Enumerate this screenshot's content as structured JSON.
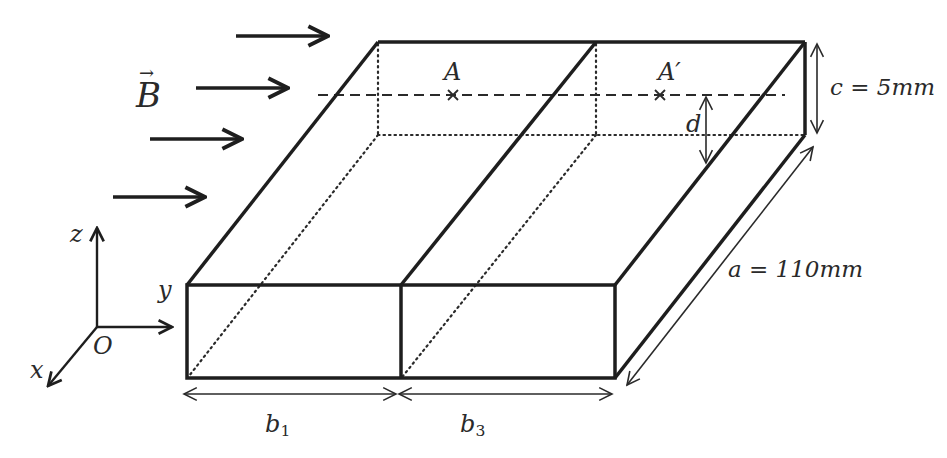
{
  "diagram": {
    "type": "3d-box-with-magnetic-field",
    "field": {
      "symbol": "B",
      "vector": true,
      "direction": "+y",
      "arrow_count": 4
    },
    "axes": {
      "origin": "O",
      "x": "x",
      "y": "y",
      "z": "z"
    },
    "points": [
      {
        "label": "A"
      },
      {
        "label": "A′"
      }
    ],
    "dimensions": {
      "height": "c = 5mm",
      "depth": "a = 110mm",
      "offset": "d",
      "width_1": "b",
      "width_1_sub": "1",
      "width_2": "b",
      "width_2_sub": "3"
    },
    "colors": {
      "stroke": "#1e1e1e",
      "text": "#2a2a2a",
      "background": "#ffffff"
    }
  }
}
